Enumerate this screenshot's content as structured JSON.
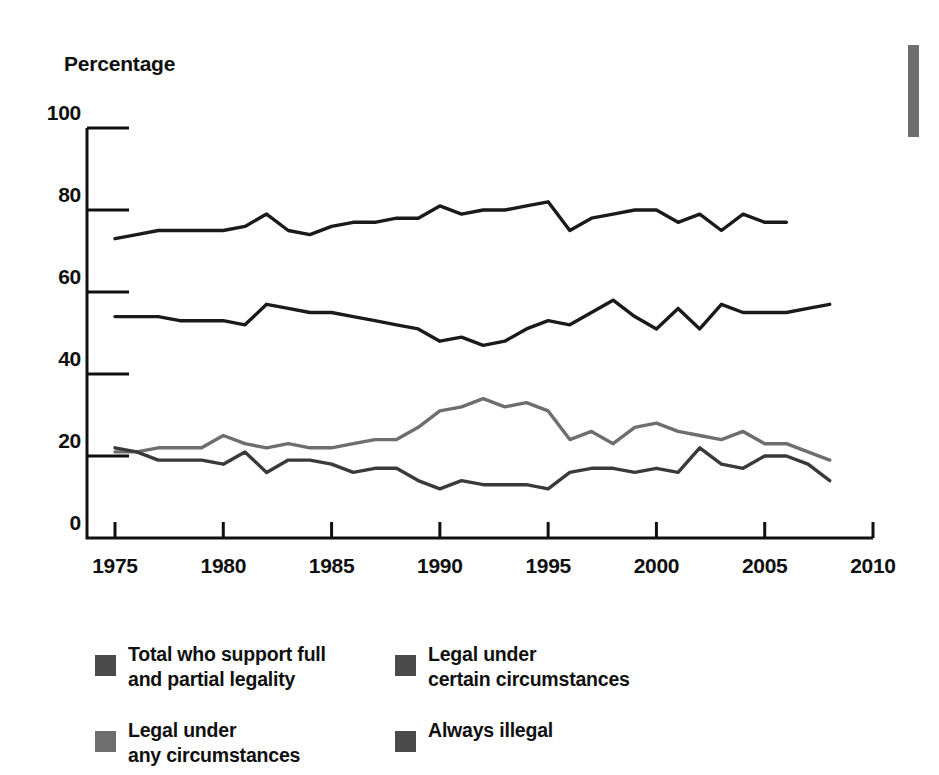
{
  "chart_data": {
    "type": "line",
    "title": "",
    "subtitle": "",
    "xlabel": "",
    "ylabel": "Percentage",
    "xlim": [
      1975,
      2010
    ],
    "ylim": [
      0,
      100
    ],
    "grid": false,
    "legend_position": "bottom",
    "y_ticks": [
      "0",
      "20",
      "40",
      "60",
      "80",
      "100"
    ],
    "y_tick_values": [
      0,
      20,
      40,
      60,
      80,
      100
    ],
    "x_ticks": [
      "1975",
      "1980",
      "1985",
      "1990",
      "1995",
      "2000",
      "2005",
      "2010"
    ],
    "x_tick_values": [
      1975,
      1980,
      1985,
      1990,
      1995,
      2000,
      2005,
      2010
    ],
    "series": [
      {
        "name": "Total who support full and partial legality",
        "color": "#1a1a1a",
        "x": [
          1975,
          1976,
          1977,
          1978,
          1979,
          1980,
          1981,
          1982,
          1983,
          1984,
          1985,
          1986,
          1987,
          1988,
          1989,
          1990,
          1991,
          1992,
          1993,
          1994,
          1995,
          1996,
          1997,
          1998,
          1999,
          2000,
          2001,
          2002,
          2003,
          2004,
          2005,
          2006
        ],
        "values": [
          73,
          74,
          75,
          75,
          75,
          75,
          76,
          79,
          75,
          74,
          76,
          77,
          77,
          78,
          78,
          81,
          79,
          80,
          80,
          81,
          82,
          75,
          78,
          79,
          80,
          80,
          77,
          79,
          75,
          79,
          77,
          77
        ]
      },
      {
        "name": "Legal under certain circumstances",
        "color": "#1a1a1a",
        "x": [
          1975,
          1976,
          1977,
          1978,
          1979,
          1980,
          1981,
          1982,
          1983,
          1984,
          1985,
          1986,
          1987,
          1988,
          1989,
          1990,
          1991,
          1992,
          1993,
          1994,
          1995,
          1996,
          1997,
          1998,
          1999,
          2000,
          2001,
          2002,
          2003,
          2004,
          2005,
          2006,
          2007,
          2008
        ],
        "values": [
          54,
          54,
          54,
          53,
          53,
          53,
          52,
          57,
          56,
          55,
          55,
          54,
          53,
          52,
          51,
          48,
          49,
          47,
          48,
          51,
          53,
          52,
          55,
          58,
          54,
          51,
          56,
          51,
          57,
          55,
          55,
          55,
          56,
          57
        ]
      },
      {
        "name": "Legal under any circumstances",
        "color": "#6e6e6e",
        "x": [
          1975,
          1976,
          1977,
          1978,
          1979,
          1980,
          1981,
          1982,
          1983,
          1984,
          1985,
          1986,
          1987,
          1988,
          1989,
          1990,
          1991,
          1992,
          1993,
          1994,
          1995,
          1996,
          1997,
          1998,
          1999,
          2000,
          2001,
          2002,
          2003,
          2004,
          2005,
          2006,
          2007,
          2008
        ],
        "values": [
          21,
          21,
          22,
          22,
          22,
          25,
          23,
          22,
          23,
          22,
          22,
          23,
          24,
          24,
          27,
          31,
          32,
          34,
          32,
          33,
          31,
          24,
          26,
          23,
          27,
          28,
          26,
          25,
          24,
          26,
          23,
          23,
          21,
          19
        ]
      },
      {
        "name": "Always illegal",
        "color": "#3a3a3a",
        "x": [
          1975,
          1976,
          1977,
          1978,
          1979,
          1980,
          1981,
          1982,
          1983,
          1984,
          1985,
          1986,
          1987,
          1988,
          1989,
          1990,
          1991,
          1992,
          1993,
          1994,
          1995,
          1996,
          1997,
          1998,
          1999,
          2000,
          2001,
          2002,
          2003,
          2004,
          2005,
          2006,
          2007,
          2008
        ],
        "values": [
          22,
          21,
          19,
          19,
          19,
          18,
          21,
          16,
          19,
          19,
          18,
          16,
          17,
          17,
          14,
          12,
          14,
          13,
          13,
          13,
          12,
          16,
          17,
          17,
          16,
          17,
          16,
          22,
          18,
          17,
          20,
          20,
          18,
          14
        ]
      }
    ]
  },
  "axis": {
    "y_title": "Percentage"
  },
  "legend": {
    "items": [
      {
        "label": "Total who support full and partial legality",
        "line1": "Total who support full",
        "line2": "and partial legality",
        "swatch_color": "#4a4a4a"
      },
      {
        "label": "Legal under certain circumstances",
        "line1": "Legal under",
        "line2": "certain circumstances",
        "swatch_color": "#4a4a4a"
      },
      {
        "label": "Legal under any circumstances",
        "line1": "Legal under",
        "line2": "any circumstances",
        "swatch_color": "#6e6e6e"
      },
      {
        "label": "Always illegal",
        "line1": "Always illegal",
        "line2": "",
        "swatch_color": "#4a4a4a"
      }
    ]
  }
}
